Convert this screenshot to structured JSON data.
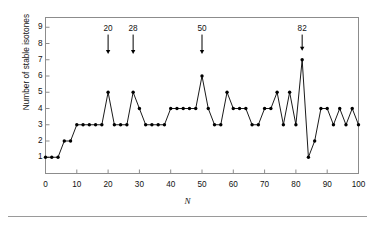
{
  "figure": {
    "name": "stable-isotones-vs-neutron-number",
    "background_color": "#ffffff",
    "line_color": "#000000",
    "frame_color": "#8c8c8c",
    "rule_color": "#9a9a9a"
  },
  "axes": {
    "y_label": "Number of stable isotones",
    "x_label": "N",
    "y_ticks": [
      "1",
      "2",
      "3",
      "4",
      "5",
      "6",
      "7",
      "8",
      "9"
    ],
    "x_ticks": [
      "0",
      "10",
      "20",
      "30",
      "40",
      "50",
      "60",
      "70",
      "80",
      "90",
      "100"
    ]
  },
  "annotations": [
    {
      "label": "20",
      "x": 20,
      "arrow_top": 8.55,
      "arrow_bottom": 7.35
    },
    {
      "label": "28",
      "x": 28,
      "arrow_top": 8.55,
      "arrow_bottom": 7.35
    },
    {
      "label": "50",
      "x": 50,
      "arrow_top": 8.55,
      "arrow_bottom": 7.35
    },
    {
      "label": "82",
      "x": 82,
      "arrow_top": 8.55,
      "arrow_bottom": 7.55
    }
  ],
  "chart_data": {
    "type": "line",
    "title": "",
    "xlabel": "N",
    "ylabel": "Number of stable isotones",
    "xlim": [
      0,
      100
    ],
    "ylim": [
      0,
      9.6
    ],
    "grid": false,
    "legend": "none",
    "marker": "filled-circle",
    "x": [
      0,
      2,
      4,
      6,
      8,
      10,
      12,
      14,
      16,
      18,
      20,
      22,
      24,
      26,
      28,
      30,
      32,
      34,
      36,
      38,
      40,
      42,
      44,
      46,
      48,
      50,
      52,
      54,
      56,
      58,
      60,
      62,
      64,
      66,
      68,
      70,
      72,
      74,
      76,
      78,
      80,
      82,
      84,
      86,
      88,
      90,
      92,
      94,
      96,
      98,
      100
    ],
    "values": [
      1,
      1,
      1,
      2,
      2,
      3,
      3,
      3,
      3,
      3,
      5,
      3,
      3,
      3,
      5,
      4,
      3,
      3,
      3,
      3,
      4,
      4,
      4,
      4,
      4,
      6,
      4,
      3,
      3,
      5,
      4,
      4,
      4,
      3,
      3,
      4,
      4,
      5,
      3,
      5,
      3,
      7,
      1,
      2,
      4,
      4,
      3,
      4,
      3,
      4,
      3
    ],
    "annotations": [
      {
        "label": "20",
        "x": 20,
        "note": "magic number"
      },
      {
        "label": "28",
        "x": 28,
        "note": "magic number"
      },
      {
        "label": "50",
        "x": 50,
        "note": "magic number"
      },
      {
        "label": "82",
        "x": 82,
        "note": "magic number"
      }
    ]
  }
}
